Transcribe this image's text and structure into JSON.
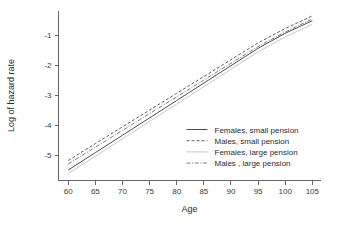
{
  "figure": {
    "background": "#ffffff",
    "width": 340,
    "height": 225
  },
  "chart_data": {
    "type": "line",
    "title": "",
    "xlabel": "Age",
    "ylabel": "Log of hazard rate",
    "xlim": [
      58.2,
      106.5
    ],
    "ylim": [
      -5.85,
      -0.18
    ],
    "xticks": [
      60,
      65,
      70,
      75,
      80,
      85,
      90,
      95,
      100,
      105
    ],
    "xticklabels": [
      "60",
      "65",
      "70",
      "75",
      "80",
      "85",
      "90",
      "95",
      "100",
      "105"
    ],
    "yticks": [
      -1,
      -2,
      -3,
      -4,
      -5
    ],
    "yticklabels": [
      "-1",
      "-2",
      "-3",
      "-4",
      "-5"
    ],
    "grid": false,
    "legend_position": "lower right inside axes",
    "x": [
      60,
      65,
      70,
      75,
      80,
      85,
      90,
      95,
      100,
      105
    ],
    "series": [
      {
        "name": "Females, small pension",
        "style": "solid",
        "color": "#4d4d4d",
        "width": 1.0,
        "values": [
          -5.5,
          -4.92,
          -4.34,
          -3.76,
          -3.18,
          -2.6,
          -2.02,
          -1.44,
          -0.94,
          -0.52
        ]
      },
      {
        "name": "Males, small pension",
        "style": "dashed",
        "color": "#4d4d4d",
        "width": 0.9,
        "values": [
          -5.18,
          -4.62,
          -4.06,
          -3.5,
          -2.94,
          -2.38,
          -1.82,
          -1.26,
          -0.78,
          -0.36
        ]
      },
      {
        "name": "Females, large pension",
        "style": "solid-light",
        "color": "#c8c8c8",
        "width": 1.0,
        "values": [
          -5.62,
          -5.04,
          -4.46,
          -3.88,
          -3.3,
          -2.72,
          -2.14,
          -1.56,
          -1.06,
          -0.64
        ]
      },
      {
        "name": "Males , large pension",
        "style": "dashdot",
        "color": "#6b6b6b",
        "width": 0.9,
        "values": [
          -5.3,
          -4.74,
          -4.18,
          -3.62,
          -3.06,
          -2.5,
          -1.94,
          -1.38,
          -0.9,
          -0.46
        ]
      }
    ]
  },
  "legend": {
    "entries": [
      {
        "label": "Females, small pension"
      },
      {
        "label": "Males, small pension"
      },
      {
        "label": "Females, large pension"
      },
      {
        "label": "Males , large pension"
      }
    ]
  }
}
